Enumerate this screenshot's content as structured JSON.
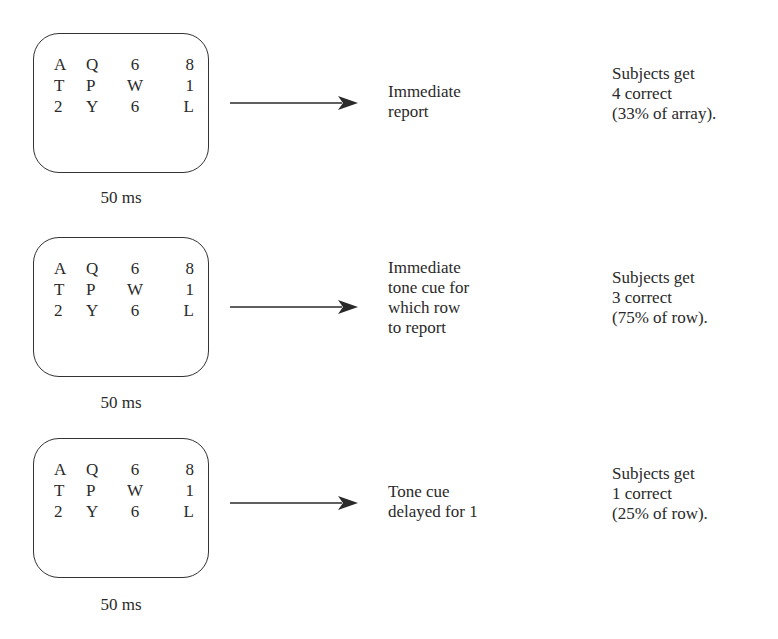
{
  "figure": {
    "type": "sperling_partial_report_diagram"
  },
  "panels": [
    {
      "array": [
        [
          "A",
          "Q",
          "6",
          "8"
        ],
        [
          "T",
          "P",
          "W",
          "1"
        ],
        [
          "2",
          "Y",
          "6",
          "L"
        ]
      ],
      "duration": "50 ms",
      "cue": "Immediate\nreport",
      "result": "Subjects get\n4 correct\n(33% of array)."
    },
    {
      "array": [
        [
          "A",
          "Q",
          "6",
          "8"
        ],
        [
          "T",
          "P",
          "W",
          "1"
        ],
        [
          "2",
          "Y",
          "6",
          "L"
        ]
      ],
      "duration": "50 ms",
      "cue": "Immediate\ntone cue for\nwhich row\nto report",
      "result": "Subjects get\n3 correct\n(75% of row)."
    },
    {
      "array": [
        [
          "A",
          "Q",
          "6",
          "8"
        ],
        [
          "T",
          "P",
          "W",
          "1"
        ],
        [
          "2",
          "Y",
          "6",
          "L"
        ]
      ],
      "duration": "50 ms",
      "cue": "Tone cue\ndelayed for 1",
      "result": "Subjects get\n1 correct\n(25% of row)."
    }
  ],
  "colors": {
    "ink": "#2a2a2a",
    "background": "#ffffff"
  }
}
